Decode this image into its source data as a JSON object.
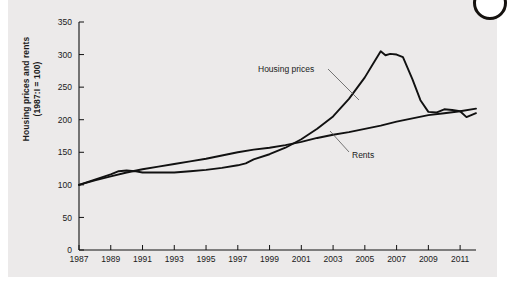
{
  "figure": {
    "background_color": "#eceaea",
    "line_color": "#111111",
    "annotation_color": "#1a1a1a"
  },
  "axis_label": {
    "line1": "Housing prices and rents",
    "line2": "(1987:I = 100)"
  },
  "annotations": {
    "housing": "Housing prices",
    "rents": "Rents"
  },
  "chart_data": {
    "type": "line",
    "title": "",
    "subtitle": "",
    "xlabel": "",
    "ylabel": "Housing prices and rents (1987:I = 100)",
    "xlim": [
      1987,
      2012
    ],
    "ylim": [
      0,
      350
    ],
    "ytick_step": 50,
    "yticks": [
      0,
      50,
      100,
      150,
      200,
      250,
      300,
      350
    ],
    "xticks": [
      1987,
      1989,
      1991,
      1993,
      1995,
      1997,
      1999,
      2001,
      2003,
      2005,
      2007,
      2009,
      2011
    ],
    "xtick_labels": [
      "1987",
      "1989",
      "1991",
      "1993",
      "1995",
      "1997",
      "1999",
      "2001",
      "2003",
      "2005",
      "2007",
      "2009",
      "2011"
    ],
    "grid": false,
    "legend": "annotated-inline",
    "legend_position": "inline",
    "series": [
      {
        "name": "Housing prices",
        "color": "#111111",
        "x": [
          1987,
          1988,
          1989,
          1989.5,
          1990,
          1990.5,
          1991,
          1992,
          1993,
          1994,
          1995,
          1996,
          1997,
          1997.5,
          1998,
          1999,
          2000,
          2001,
          2002,
          2003,
          2004,
          2005,
          2005.5,
          2006,
          2006.3,
          2006.6,
          2007,
          2007.4,
          2008,
          2008.5,
          2009,
          2009.5,
          2010,
          2010.5,
          2011,
          2011.4,
          2012
        ],
        "values": [
          100,
          108,
          116,
          121,
          122,
          121,
          119,
          119,
          119,
          121,
          123,
          126,
          130,
          133,
          139,
          147,
          157,
          170,
          186,
          205,
          232,
          265,
          285,
          305,
          299,
          301,
          300,
          296,
          262,
          230,
          212,
          211,
          216,
          215,
          213,
          204,
          210
        ]
      },
      {
        "name": "Rents",
        "color": "#111111",
        "x": [
          1987,
          1988,
          1989,
          1990,
          1991,
          1992,
          1993,
          1994,
          1995,
          1996,
          1997,
          1998,
          1999,
          2000,
          2001,
          2002,
          2003,
          2004,
          2005,
          2006,
          2007,
          2008,
          2009,
          2010,
          2011,
          2012
        ],
        "values": [
          100,
          107,
          113,
          119,
          124,
          128,
          132,
          136,
          140,
          145,
          150,
          154,
          157,
          161,
          166,
          172,
          177,
          181,
          186,
          191,
          197,
          202,
          207,
          210,
          213,
          217
        ]
      }
    ]
  }
}
